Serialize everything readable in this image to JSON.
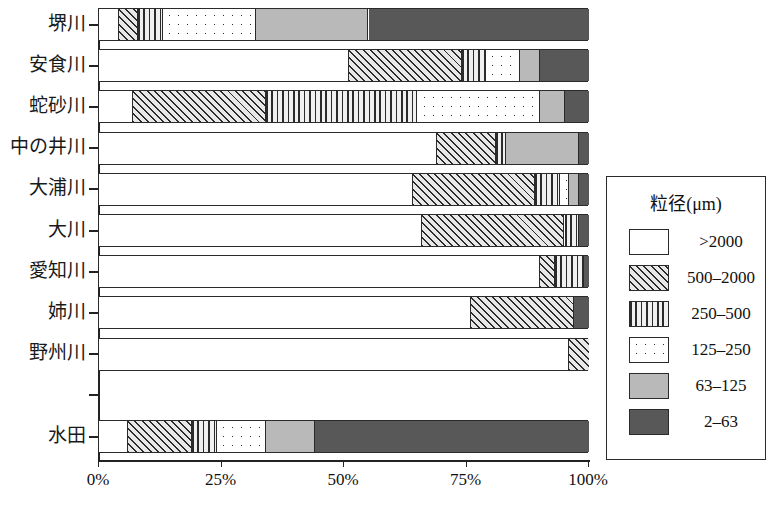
{
  "chart_data": {
    "type": "bar",
    "orientation": "horizontal",
    "stacked": true,
    "title": "",
    "xlabel": "",
    "ylabel": "",
    "xlim": [
      0,
      100
    ],
    "xticks": [
      "0%",
      "25%",
      "50%",
      "75%",
      "100%"
    ],
    "xtick_values": [
      0,
      25,
      50,
      75,
      100
    ],
    "grid": false,
    "legend_position": "right",
    "legend_title": "粒径(μm)",
    "categories": [
      "堺川",
      "安食川",
      "蛇砂川",
      "中の井川",
      "大浦川",
      "大川",
      "愛知川",
      "姉川",
      "野州川",
      "",
      "水田"
    ],
    "series": [
      {
        "name": ">2000",
        "pattern": "white",
        "values": [
          4.0,
          51.0,
          7.0,
          69.0,
          64.0,
          66.0,
          90.0,
          76.0,
          96.0,
          0,
          6.0
        ]
      },
      {
        "name": "500-2000",
        "pattern": "diagonal",
        "values": [
          4.0,
          23.0,
          27.0,
          12.0,
          25.0,
          29.0,
          3.0,
          21.0,
          4.0,
          0,
          13.0
        ]
      },
      {
        "name": "250-500",
        "pattern": "vertical",
        "values": [
          5.0,
          5.0,
          31.0,
          2.0,
          5.0,
          3.0,
          6.0,
          0.0,
          0.0,
          0,
          5.0
        ]
      },
      {
        "name": "125-250",
        "pattern": "dots",
        "values": [
          19.0,
          7.0,
          25.0,
          0.0,
          2.0,
          0.0,
          0.0,
          0.0,
          0.0,
          0,
          10.0
        ]
      },
      {
        "name": "63-125",
        "pattern": "lightgray",
        "values": [
          23.0,
          4.0,
          5.0,
          15.0,
          2.0,
          0.0,
          0.0,
          0.0,
          0.0,
          0,
          10.0
        ]
      },
      {
        "name": "2-63",
        "pattern": "darkgray",
        "values": [
          45.0,
          10.0,
          5.0,
          2.0,
          2.0,
          2.0,
          1.0,
          3.0,
          0.0,
          0,
          56.0
        ]
      }
    ]
  },
  "legend": {
    "title": "粒径(μm)",
    "items": [
      {
        "label": ">2000",
        "pattern": "white"
      },
      {
        "label": "500–2000",
        "pattern": "diagonal"
      },
      {
        "label": "250–500",
        "pattern": "vertical"
      },
      {
        "label": "125–250",
        "pattern": "dots"
      },
      {
        "label": "63–125",
        "pattern": "lightgray"
      },
      {
        "label": "2–63",
        "pattern": "darkgray"
      }
    ]
  },
  "colors": {
    "ink": "#222222",
    "light_gray": "#b9b9b9",
    "dark_gray": "#585858",
    "background": "#ffffff"
  }
}
